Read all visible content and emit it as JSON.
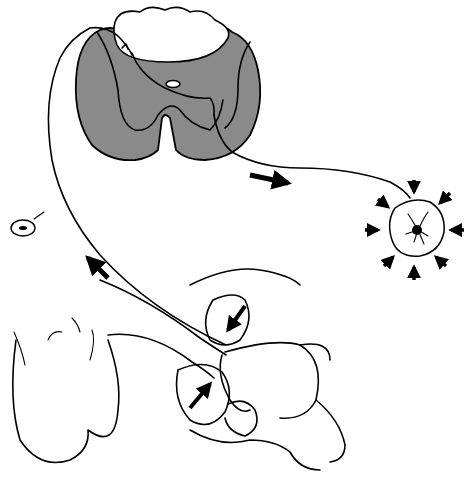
{
  "figure": {
    "description": "Line drawing of a reflex arc: spinal cord cross-section connected by afferent and efferent nerve fibers to external genital region and a contracting muscle",
    "colors": {
      "gray_matter": "#8a8a8a",
      "line": "#000000",
      "background": "#ffffff"
    },
    "elements": {
      "spinal_cord": "spinal-cord-cross-section",
      "afferent_arrow": "arrow-up-left",
      "efferent_arrow": "arrow-right",
      "ganglion": "dorsal-root-ganglion",
      "muscle": "contracting-muscle-with-inward-arrows",
      "stimulus_arrows": [
        "squeeze-arrow-down",
        "squeeze-arrow-up"
      ]
    }
  }
}
